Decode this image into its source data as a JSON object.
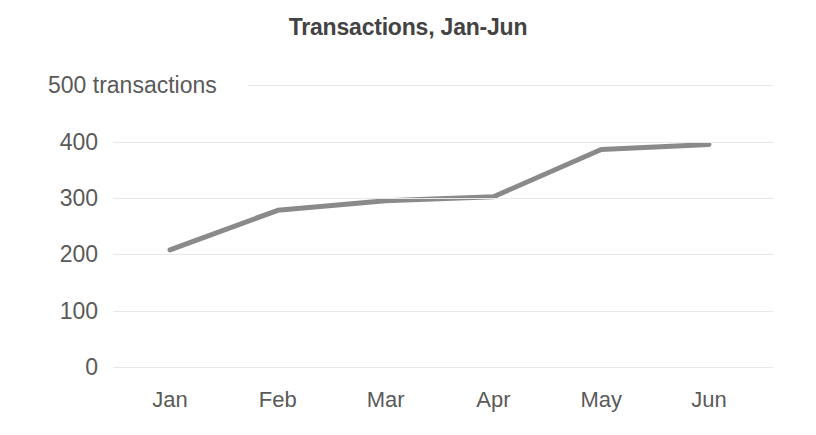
{
  "chart_data": {
    "type": "line",
    "title": "Transactions, Jan-Jun",
    "xlabel": "",
    "ylabel": "transactions",
    "categories": [
      "Jan",
      "Feb",
      "Mar",
      "Apr",
      "May",
      "Jun"
    ],
    "values": [
      208,
      278,
      295,
      302,
      386,
      395
    ],
    "series": [
      {
        "name": "Transactions",
        "values": [
          208,
          278,
          295,
          302,
          386,
          395
        ]
      }
    ],
    "ylim": [
      0,
      500
    ],
    "ytick_values": [
      0,
      100,
      200,
      300,
      400,
      500
    ],
    "ytick_labels": [
      "0",
      "100",
      "200",
      "300",
      "400",
      "500 transactions"
    ],
    "grid": true,
    "legend": "none",
    "line_color": "#8a8a8a",
    "grid_color": "#e8e8e8",
    "title_color": "#434343",
    "tick_color": "#5a5a5a",
    "background_color": "#ffffff"
  }
}
